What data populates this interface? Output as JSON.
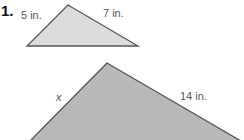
{
  "problem": {
    "number": "1.",
    "small_triangle": {
      "side_left_label": "5 in.",
      "side_right_label": "7 in.",
      "fill": "#dcdcdc",
      "stroke": "#555555",
      "vertices": [
        [
          68,
          5
        ],
        [
          27,
          46
        ],
        [
          138,
          46
        ]
      ]
    },
    "large_triangle": {
      "side_left_label": "x",
      "side_right_label": "14 in.",
      "fill": "#b9b9b9",
      "stroke": "#555555",
      "vertices": [
        [
          107,
          63
        ],
        [
          30,
          140
        ],
        [
          240,
          140
        ]
      ]
    }
  }
}
